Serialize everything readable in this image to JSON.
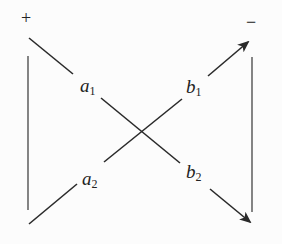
{
  "diagram": {
    "terminals": {
      "left_sign": "+",
      "right_sign": "−"
    },
    "ports": [
      {
        "id": "a1",
        "var": "a",
        "sub": "1"
      },
      {
        "id": "a2",
        "var": "a",
        "sub": "2"
      },
      {
        "id": "b1",
        "var": "b",
        "sub": "1"
      },
      {
        "id": "b2",
        "var": "b",
        "sub": "2"
      }
    ],
    "edges": [
      {
        "from": "+",
        "via": [
          "a1",
          "b2"
        ],
        "to": "bottom-right",
        "arrow": true
      },
      {
        "from": "bottom-left",
        "via": [
          "a2",
          "b1"
        ],
        "to": "−",
        "arrow": true
      }
    ],
    "colors": {
      "line": "#2a2a2a",
      "background": "#fcfcfc"
    }
  }
}
